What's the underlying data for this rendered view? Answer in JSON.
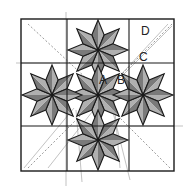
{
  "diagram": {
    "labels": [
      {
        "id": "A",
        "text": "A",
        "x": 99,
        "y": 84
      },
      {
        "id": "B",
        "text": "B",
        "x": 117,
        "y": 84
      },
      {
        "id": "C",
        "text": "C",
        "x": 139,
        "y": 61
      },
      {
        "id": "D",
        "text": "D",
        "x": 141,
        "y": 35
      }
    ],
    "colors": {
      "rhombus_dark": "#7a7a7a",
      "rhombus_light": "#b0b0b0",
      "outline": "#1a1a1a",
      "guide": "#999999"
    },
    "stars": [
      {
        "name": "top",
        "cx": 98,
        "cy": 50,
        "R": 30
      },
      {
        "name": "center",
        "cx": 98,
        "cy": 95,
        "R": 30
      },
      {
        "name": "left",
        "cx": 52,
        "cy": 95,
        "R": 30
      },
      {
        "name": "right",
        "cx": 143,
        "cy": 95,
        "R": 30
      },
      {
        "name": "bottom",
        "cx": 98,
        "cy": 140,
        "R": 30
      }
    ]
  }
}
